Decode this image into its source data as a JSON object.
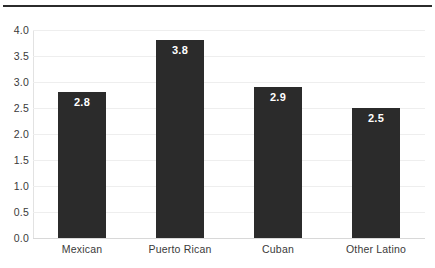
{
  "chart_data": {
    "type": "bar",
    "title": "",
    "subtitle": "",
    "xlabel": "",
    "ylabel": "",
    "categories": [
      "Mexican",
      "Puerto Rican",
      "Cuban",
      "Other Latino"
    ],
    "values": [
      2.8,
      3.8,
      2.9,
      2.5
    ],
    "value_labels": [
      "2.8",
      "3.8",
      "2.9",
      "2.5"
    ],
    "ylim": [
      0.0,
      4.0
    ],
    "ytick_labels": [
      "0.0",
      "0.5",
      "1.0",
      "1.5",
      "2.0",
      "2.5",
      "3.0",
      "3.5",
      "4.0"
    ],
    "ytick_values": [
      0.0,
      0.5,
      1.0,
      1.5,
      2.0,
      2.5,
      3.0,
      3.5,
      4.0
    ],
    "grid": true,
    "grid_axis": "y",
    "legend": false,
    "legend_position": "none",
    "bar_color": "#2b2b2b",
    "value_label_color": "#ffffff",
    "gridline_color": "#eeeeee",
    "background_color": "#ffffff",
    "axis_text_color": "#3a3a3a",
    "top_rule_color": "#2b2b2b"
  }
}
